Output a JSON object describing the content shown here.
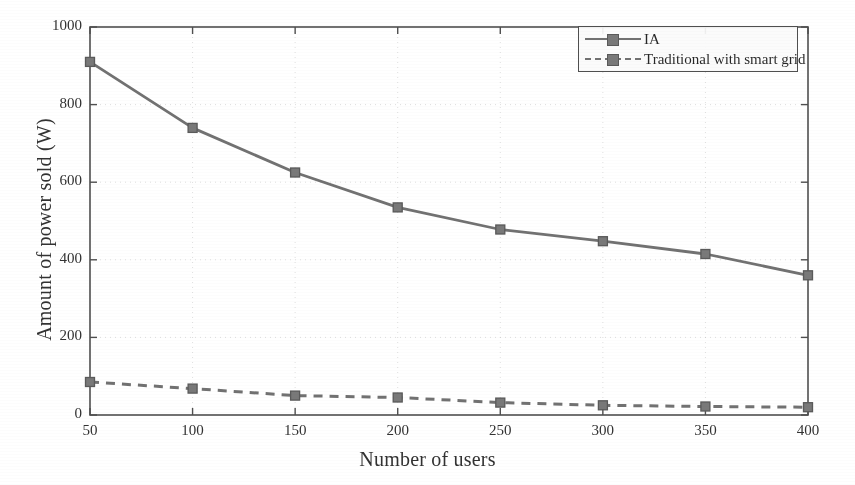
{
  "chart_data": {
    "type": "line",
    "title": "",
    "xlabel": "Number of users",
    "ylabel": "Amount of power sold (W)",
    "x": [
      50,
      100,
      150,
      200,
      250,
      300,
      350,
      400
    ],
    "xticks": [
      "50",
      "100",
      "150",
      "200",
      "250",
      "300",
      "350",
      "400"
    ],
    "yticks": [
      "0",
      "200",
      "400",
      "600",
      "800",
      "1000"
    ],
    "xlim": [
      50,
      400
    ],
    "ylim": [
      0,
      1000
    ],
    "grid": true,
    "grid_style": "dotted",
    "legend_position": "top-right",
    "series": [
      {
        "name": "IA",
        "values": [
          910,
          740,
          625,
          535,
          478,
          448,
          415,
          360
        ],
        "line_style": "solid",
        "marker": "square",
        "color": "#6e6e6e"
      },
      {
        "name": "Traditional with smart grid",
        "values": [
          85,
          68,
          50,
          45,
          32,
          25,
          22,
          20
        ],
        "line_style": "dashed",
        "marker": "square",
        "color": "#6e6e6e"
      }
    ]
  },
  "legend": {
    "items": [
      {
        "label": "IA"
      },
      {
        "label": "Traditional with smart grid"
      }
    ]
  },
  "colors": {
    "series": "#6e6e6e",
    "marker_fill": "#767676",
    "marker_edge": "#555555",
    "axis": "#4a4a4a",
    "text": "#1f1f1f",
    "grid": "#bdbdbd",
    "background": "#ffffff"
  }
}
